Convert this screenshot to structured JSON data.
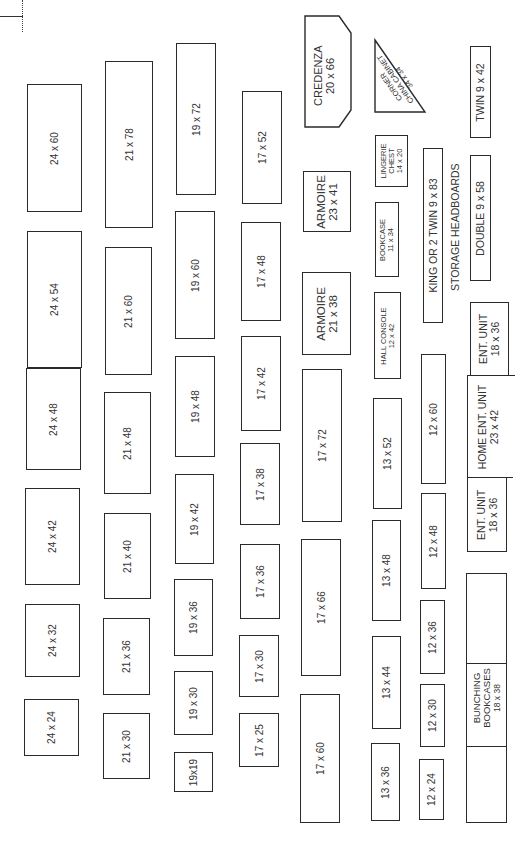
{
  "diagram": {
    "pieces": {
      "c1": [
        "24 x 60",
        "24 x 54",
        "24 x 48",
        "24 x 42",
        "24 x 32",
        "24 x 24"
      ],
      "c2": [
        "21 x 78",
        "21 x 60",
        "21 x 48",
        "21 x 40",
        "21 x 36",
        "21 x 30"
      ],
      "c3": [
        "19 x 72",
        "19 x 60",
        "19 x 48",
        "19 x 42",
        "19 x 36",
        "19 x 30",
        "19x19"
      ],
      "c4": [
        "17 x 52",
        "17 x 48",
        "17 x 42",
        "17 x 38",
        "17 x 36",
        "17 x 30",
        "17 x 25"
      ],
      "c5": [
        "17 x 72",
        "17 x 66",
        "17 x 60"
      ],
      "c6": [
        "13 x 52",
        "13 x 48",
        "13 x 44",
        "13 x 36"
      ],
      "c7": [
        "12 x 60",
        "12 x 48",
        "12 x 36",
        "12 x 30",
        "12 x 24"
      ]
    },
    "named": {
      "credenza": {
        "name": "CREDENZA",
        "dim": "20 x 66"
      },
      "armoire_1": {
        "name": "ARMOIRE",
        "dim": "23 x 41"
      },
      "armoire_2": {
        "name": "ARMOIRE",
        "dim": "21 x 38"
      },
      "corner_china": {
        "line1": "CORNER",
        "line2": "CHINA CABINET",
        "dim": "34 x 34"
      },
      "lingerie": {
        "line1": "LINGERIE",
        "line2": "CHEST",
        "dim": "14 x 20"
      },
      "bookcase": {
        "name": "BOOKCASE",
        "dim": "11 x 34"
      },
      "hall_console": {
        "name": "HALL CONSOLE",
        "dim": "12 x 42"
      },
      "king": {
        "label": "KING OR 2 TWIN 9 x 83"
      },
      "storage_headboards": "STORAGE HEADBOARDS",
      "twin": {
        "label": "TWIN 9 x 42"
      },
      "double": {
        "label": "DOUBLE 9 x 58"
      },
      "ent_unit_top": {
        "name": "ENT. UNIT",
        "dim": "18 x 36"
      },
      "home_ent_unit": {
        "name": "HOME ENT. UNIT",
        "dim": "23 x 42"
      },
      "ent_unit_bottom": {
        "name": "ENT. UNIT",
        "dim": "18 x 36"
      },
      "bunching": {
        "line1": "BUNCHING",
        "line2": "BOOKCASES",
        "dim": "18 x 38"
      }
    }
  }
}
